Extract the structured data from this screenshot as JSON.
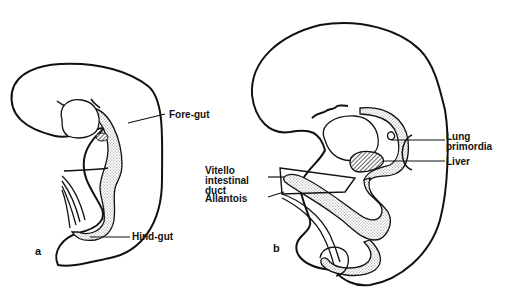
{
  "figure": {
    "panels": [
      {
        "id": "a",
        "label": "a",
        "annotations": [
          {
            "text": "Fore-gut"
          },
          {
            "text": "Hind-gut"
          }
        ]
      },
      {
        "id": "b",
        "label": "b",
        "annotations": [
          {
            "text": "Lung\nprimordia"
          },
          {
            "text": "Liver"
          },
          {
            "text": "Vitello\nintestinal\nduct"
          },
          {
            "text": "Allantois"
          }
        ]
      }
    ],
    "colors": {
      "line": "#111111",
      "gut_fill": "#d8d8d8",
      "background": "#ffffff"
    }
  }
}
